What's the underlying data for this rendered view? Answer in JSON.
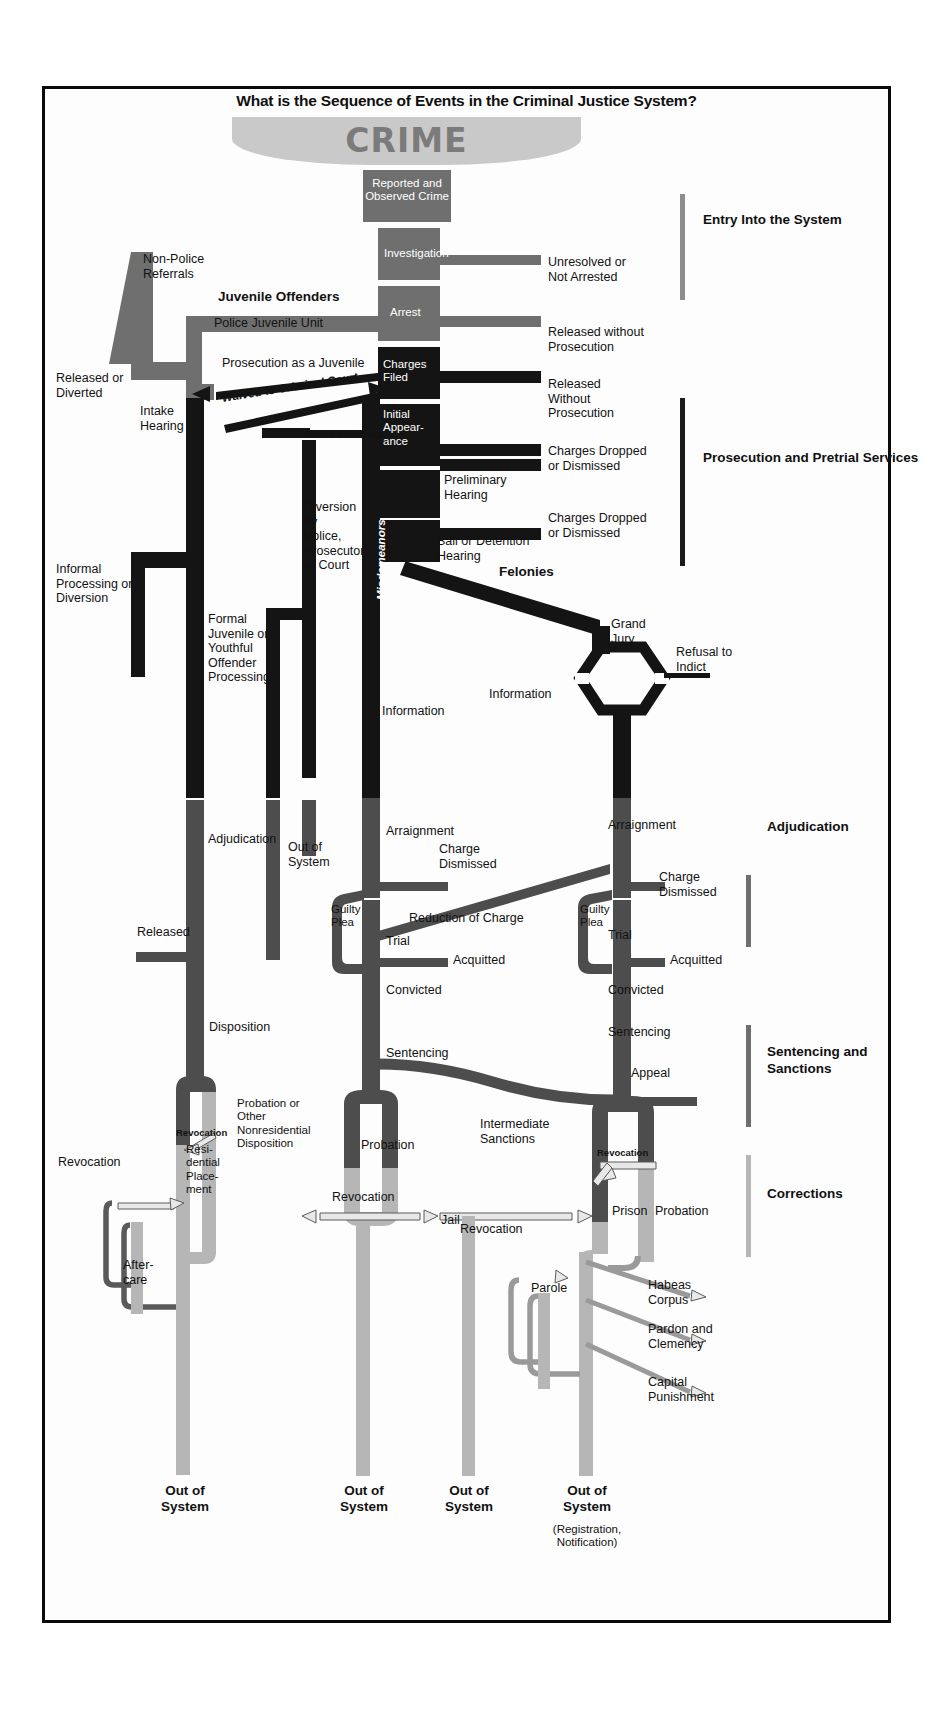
{
  "title": "What is the Sequence of Events in the Criminal Justice System?",
  "banner": {
    "label": "CRIME"
  },
  "colors": {
    "entry_flow": "#6f6f6f",
    "prosecution_flow": "#1b1b1b",
    "corrections_flow": "#b6b6b6",
    "banner_fill": "#c9c9c9",
    "banner_text": "#7b7b7b",
    "frame": "#0a0a0a"
  },
  "sections": [
    {
      "label": "Entry Into\nthe System",
      "tone": "gray"
    },
    {
      "label": "Prosecution and\nPretrial Services",
      "tone": "dark"
    },
    {
      "label": "Adjudication",
      "tone": "mid"
    },
    {
      "label": "Sentencing\nand Sanctions",
      "tone": "mid"
    },
    {
      "label": "Corrections",
      "tone": "lite"
    }
  ],
  "boxes": [
    {
      "id": "reported",
      "label": "Reported and\nObserved Crime"
    },
    {
      "id": "investigation",
      "label": "Investigation"
    },
    {
      "id": "arrest",
      "label": "Arrest"
    },
    {
      "id": "charges_filed",
      "label": "Charges\nFiled"
    },
    {
      "id": "initial_appearance",
      "label": "Initial\nAppear-\nance"
    }
  ],
  "entry_stage": {
    "non_police_referrals": "Non-Police\nReferrals",
    "unresolved": "Unresolved or\nNot Arrested",
    "released_without_prosecution_1": "Released without\nProsecution"
  },
  "juvenile": {
    "heading": "Juvenile Offenders",
    "police_juvenile_unit": "Police Juvenile Unit",
    "prosecution_as_juvenile": "Prosecution as a Juvenile",
    "waived": "Waived to Criminal Court",
    "released_or_diverted": "Released or\nDiverted",
    "intake_hearing": "Intake\nHearing",
    "informal_processing": "Informal\nProcessing or\nDiversion",
    "formal_processing": "Formal\nJuvenile or\nYouthful\nOffender\nProcessing",
    "adjudication": "Adjudication",
    "released": "Released",
    "disposition": "Disposition",
    "probation_nonresidential": "Probation or\nOther\nNonresidential\nDisposition",
    "residential_placement": "Resi-\ndential\nPlace-\nment",
    "revocation_small": "Revocation",
    "revocation_left": "Revocation",
    "aftercare": "After-\ncare",
    "out_of_system": "Out of\nSystem"
  },
  "pretrial": {
    "failed_diversion": "Failed Diversion",
    "diversion_by": "Diversion\nby\nPolice,\nProsecutor\nor Court",
    "released_without_prosecution_2": "Released\nWithout\nProsecution",
    "charges_dropped_1": "Charges Dropped\nor Dismissed",
    "preliminary_hearing": "Preliminary\nHearing",
    "charges_dropped_2": "Charges Dropped\nor Dismissed",
    "bail_or_detention": "Bail or Detention\nHearing",
    "misdemeanors": "Misdemeanors",
    "felonies": "Felonies",
    "grand_jury": "Grand\nJury",
    "information_left": "Information",
    "information_mid": "Information",
    "refusal_to_indict": "Refusal to\nIndict"
  },
  "adjudication": {
    "arraignment_mis": "Arraignment",
    "arraignment_fel": "Arraignment",
    "charge_dismissed_mis": "Charge\nDismissed",
    "charge_dismissed_fel": "Charge\nDismissed",
    "guilty_plea_mis": "Guilty\nPlea",
    "guilty_plea_fel": "Guilty\nPlea",
    "reduction_of_charge": "Reduction of Charge",
    "trial_mis": "Trial",
    "trial_fel": "Trial",
    "acquitted_mis": "Acquitted",
    "acquitted_fel": "Acquitted",
    "convicted_mis": "Convicted",
    "convicted_fel": "Convicted",
    "out_of_system": "Out of\nSystem"
  },
  "sentencing": {
    "sentencing_mis": "Sentencing",
    "sentencing_fel": "Sentencing",
    "appeal": "Appeal",
    "intermediate_sanctions": "Intermediate\nSanctions"
  },
  "corrections": {
    "probation_mid": "Probation",
    "revocation_mid": "Revocation",
    "jail": "Jail",
    "revocation_prison": "Revocation",
    "prison": "Prison",
    "probation_right": "Probation",
    "revocation_parole": "Revocation",
    "parole": "Parole",
    "habeas_corpus": "Habeas\nCorpus",
    "pardon_clemency": "Pardon and\nClemency",
    "capital_punishment": "Capital\nPunishment"
  },
  "terminals": [
    {
      "label": "Out of\nSystem",
      "sub": ""
    },
    {
      "label": "Out of\nSystem",
      "sub": ""
    },
    {
      "label": "Out of\nSystem",
      "sub": ""
    },
    {
      "label": "Out of\nSystem",
      "sub": "(Registration,\nNotification)"
    }
  ]
}
